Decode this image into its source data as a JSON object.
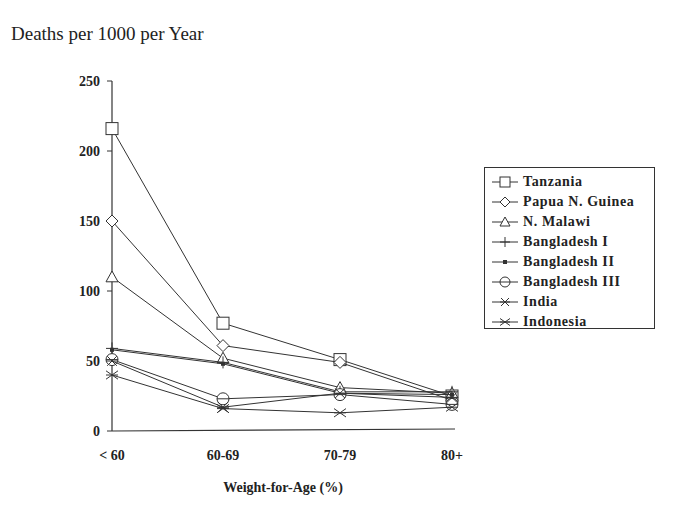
{
  "title": "Deaths per 1000 per Year",
  "chart_data": {
    "type": "line",
    "title": "Deaths per 1000 per Year",
    "xlabel": "Weight-for-Age (%)",
    "ylabel": "Deaths per 1000 per Year",
    "categories": [
      "< 60",
      "60-69",
      "70-79",
      "80+"
    ],
    "yticks": [
      0,
      50,
      100,
      150,
      200,
      250
    ],
    "ylim": [
      0,
      250
    ],
    "grid": false,
    "legend_position": "right",
    "series": [
      {
        "name": "Tanzania",
        "marker": "square",
        "values": [
          216,
          77,
          51,
          25
        ]
      },
      {
        "name": "Papua N. Guinea",
        "marker": "diamond",
        "values": [
          150,
          61,
          49,
          22
        ]
      },
      {
        "name": "N. Malawi",
        "marker": "triangle",
        "values": [
          110,
          52,
          31,
          27
        ]
      },
      {
        "name": "Bangladesh I",
        "marker": "plus",
        "values": [
          59,
          49,
          28,
          28
        ]
      },
      {
        "name": "Bangladesh II",
        "marker": "dot",
        "values": [
          58,
          48,
          27,
          26
        ]
      },
      {
        "name": "Bangladesh III",
        "marker": "circle",
        "values": [
          51,
          23,
          26,
          19
        ]
      },
      {
        "name": "India",
        "marker": "asterisk",
        "values": [
          50,
          17,
          27,
          24
        ]
      },
      {
        "name": "Indonesia",
        "marker": "x",
        "values": [
          40,
          16,
          13,
          17
        ]
      }
    ]
  },
  "colors": {
    "line": "#333333",
    "text": "#222222",
    "background": "#ffffff"
  }
}
